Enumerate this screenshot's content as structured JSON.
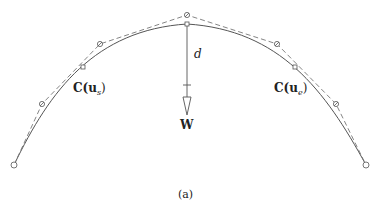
{
  "figure": {
    "caption": "(a)",
    "colors": {
      "curve": "#555555",
      "polygon": "#777777",
      "points": "#555555",
      "text": "#222222",
      "background": "#ffffff"
    }
  },
  "labels": {
    "start_point": {
      "main": "C(u",
      "sub": "s",
      "close": ")"
    },
    "end_point": {
      "main": "C(u",
      "sub": "e",
      "close": ")"
    },
    "distance": "d",
    "weight": "W"
  },
  "elements": {
    "curve": "solid arch-shaped spline curve",
    "control_polygon": "dashed polyline through control points",
    "control_points": [
      {
        "x": 14,
        "y": 165
      },
      {
        "x": 42,
        "y": 104
      },
      {
        "x": 100,
        "y": 44
      },
      {
        "x": 187,
        "y": 15
      },
      {
        "x": 277,
        "y": 44
      },
      {
        "x": 336,
        "y": 104
      },
      {
        "x": 366,
        "y": 165
      }
    ],
    "curve_points": [
      {
        "x": 83,
        "y": 67,
        "label": "C(u_s)"
      },
      {
        "x": 187,
        "y": 24,
        "label": "peak"
      },
      {
        "x": 295,
        "y": 67,
        "label": "C(u_e)"
      }
    ],
    "arrow": {
      "from": {
        "x": 187,
        "y": 24
      },
      "to": {
        "x": 187,
        "y": 115
      },
      "tick_y": 85
    }
  }
}
